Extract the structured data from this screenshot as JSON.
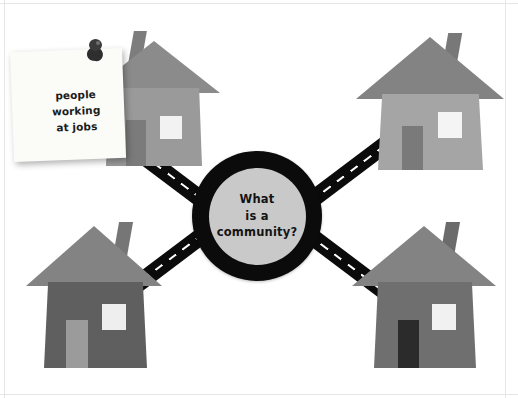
{
  "canvas": {
    "width": 518,
    "height": 398,
    "background_color": "#ffffff"
  },
  "center_node": {
    "name": "central-question",
    "text": "What\nis a\ncommunity?",
    "ring_color": "#0b0b0b",
    "fill_color": "#c9c9c9"
  },
  "sticky_note": {
    "text": "people\nworking\nat jobs",
    "paper_color": "#fbfbf8",
    "ink_color": "#1c1c1c",
    "pin_color": "#2e2e2e"
  },
  "roads": [
    {
      "name": "road-top-left",
      "label": "road to top-left house",
      "color": "#0b0b0b",
      "dash_color": "#ffffff"
    },
    {
      "name": "road-top-right",
      "label": "road to top-right house",
      "color": "#0b0b0b",
      "dash_color": "#ffffff"
    },
    {
      "name": "road-bottom-left",
      "label": "road to bottom-left house",
      "color": "#0b0b0b",
      "dash_color": "#ffffff"
    },
    {
      "name": "road-bottom-right",
      "label": "road to bottom-right house",
      "color": "#0b0b0b",
      "dash_color": "#ffffff"
    }
  ],
  "houses": [
    {
      "name": "house-top-left",
      "position": "top-left",
      "roof_color": "#8b8b8b",
      "body_color": "#9a9a9a",
      "door_color": "#7b7b7b",
      "window_color": "#f2f2f2",
      "chimney_color": "#7d7d7d"
    },
    {
      "name": "house-top-right",
      "position": "top-right",
      "roof_color": "#838383",
      "body_color": "#a5a5a5",
      "door_color": "#7a7a7a",
      "window_color": "#f4f4f4",
      "chimney_color": "#787878"
    },
    {
      "name": "house-bottom-left",
      "position": "bottom-left",
      "roof_color": "#838383",
      "body_color": "#5f5f5f",
      "door_color": "#9b9b9b",
      "window_color": "#eeeeee",
      "chimney_color": "#767676"
    },
    {
      "name": "house-bottom-right",
      "position": "bottom-right",
      "roof_color": "#838383",
      "body_color": "#6f6f6f",
      "door_color": "#2b2b2b",
      "window_color": "#f1f1f1",
      "chimney_color": "#6b6b6b"
    }
  ]
}
